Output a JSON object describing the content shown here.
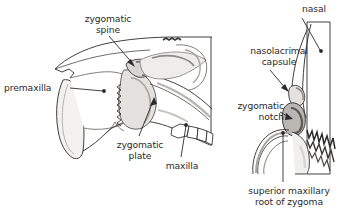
{
  "figure": {
    "background_color": "#ffffff",
    "ink_color": "#2b2b2b",
    "bone_fill": "#ffffff",
    "shade_light": "#d9d6d2",
    "shade_mid": "#a8a49f",
    "shade_dark": "#6d6a66"
  },
  "panels": [
    {
      "name": "lateral-view",
      "position": "left",
      "description": "Lateral view of the rostrum showing premaxilla, zygomatic plate, zygomatic spine and maxillary tooth row"
    },
    {
      "name": "anterior-view",
      "position": "right",
      "description": "Anterior (frontal) view showing nasal, nasolacrimal capsule, zygomatic notch and superior maxillary root of zygoma"
    }
  ],
  "labels": [
    {
      "id": "zygomatic-spine",
      "lines": [
        "zygomatic",
        "spine"
      ],
      "line1": "zygomatic",
      "line2": "spine",
      "panel": "lateral-view",
      "align": "center",
      "x": 73,
      "y": 13,
      "w": 70,
      "leader": "arrow"
    },
    {
      "id": "premaxilla",
      "lines": [
        "premaxilla"
      ],
      "line1": "premaxilla",
      "panel": "lateral-view",
      "align": "left",
      "x": 4,
      "y": 82,
      "w": 64,
      "leader": "dot"
    },
    {
      "id": "zygomatic-plate",
      "lines": [
        "zygomatic",
        "plate"
      ],
      "line1": "zygomatic",
      "line2": "plate",
      "panel": "lateral-view",
      "align": "center",
      "x": 108,
      "y": 139,
      "w": 64,
      "leader": "arrow"
    },
    {
      "id": "maxilla",
      "lines": [
        "maxilla"
      ],
      "line1": "maxilla",
      "panel": "lateral-view",
      "align": "center",
      "x": 160,
      "y": 160,
      "w": 44,
      "leader": "dot"
    },
    {
      "id": "nasal",
      "lines": [
        "nasal"
      ],
      "line1": "nasal",
      "panel": "anterior-view",
      "align": "center",
      "x": 296,
      "y": 3,
      "w": 36,
      "leader": "dot"
    },
    {
      "id": "nasolacrimal-capsule",
      "lines": [
        "nasolacrimal",
        "capsule"
      ],
      "line1": "nasolacrimal",
      "line2": "capsule",
      "panel": "anterior-view",
      "align": "center",
      "x": 238,
      "y": 45,
      "w": 82,
      "leader": "arrow"
    },
    {
      "id": "zygomatic-notch",
      "lines": [
        "zygomatic",
        "notch"
      ],
      "line1": "zygomatic",
      "line2": "notch",
      "panel": "anterior-view",
      "align": "right",
      "x": 216,
      "y": 100,
      "w": 68,
      "leader": "arrow"
    },
    {
      "id": "superior-maxillary-root-of-zygoma",
      "lines": [
        "superior maxillary",
        "root of zygoma"
      ],
      "line1": "superior maxillary",
      "line2": "root of zygoma",
      "panel": "anterior-view",
      "align": "center",
      "x": 240,
      "y": 185,
      "w": 98,
      "leader": "dot"
    }
  ]
}
